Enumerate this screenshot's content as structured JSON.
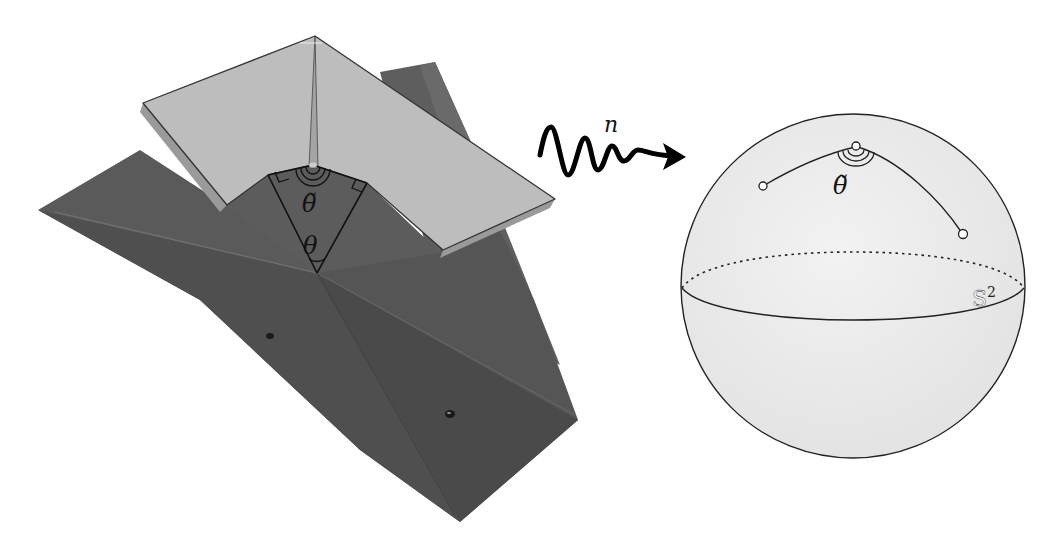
{
  "figure": {
    "left_panel": {
      "description": "Photograph of a folded (origami-like) structure with a light crease pattern plate over a dark base",
      "labels": {
        "theta_tilde": "θ̃",
        "theta": "θ"
      },
      "colors": {
        "dark_base": "#555555",
        "dark_base_shadow": "#4a4a4a",
        "light_plate": "#bdbdbd",
        "line": "#111111"
      }
    },
    "arrow": {
      "label": "n",
      "description": "wavy arrow (map n)"
    },
    "right_panel": {
      "description": "Sphere with geodesic path and angle",
      "sphere_label_base": "S",
      "sphere_label_sup": "2",
      "angle_label": "θ̃",
      "colors": {
        "sphere_fill": "#ececec",
        "line": "#222222"
      }
    }
  }
}
